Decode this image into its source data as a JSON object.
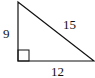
{
  "diagram": {
    "type": "right-triangle",
    "sides": {
      "vertical_leg": "9",
      "hypotenuse": "15",
      "horizontal_leg": "12"
    },
    "right_angle_marker": "square",
    "colors": {
      "stroke": "#111111",
      "background": "#ffffff"
    }
  }
}
